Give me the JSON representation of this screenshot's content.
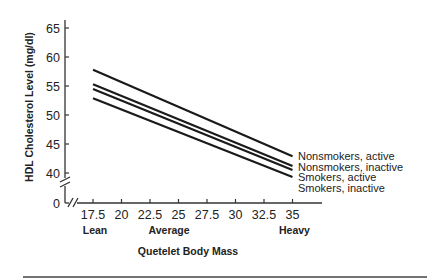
{
  "chart_data": {
    "type": "line",
    "title": "",
    "xlabel": "Quetelet Body Mass",
    "ylabel": "HDL Cholesterol Level (mg/dl)",
    "x_ticks": [
      "17.5",
      "20",
      "22.5",
      "25",
      "27.5",
      "30",
      "32.5",
      "35"
    ],
    "x_tick_values": [
      17.5,
      20,
      22.5,
      25,
      27.5,
      30,
      32.5,
      35
    ],
    "x_categories": [
      {
        "label": "Lean",
        "at": 17.5
      },
      {
        "label": "Average",
        "at": 24
      },
      {
        "label": "Heavy",
        "at": 35
      }
    ],
    "y_ticks": [
      "65",
      "60",
      "55",
      "50",
      "45",
      "40",
      "0"
    ],
    "y_tick_values": [
      65,
      60,
      55,
      50,
      45,
      40,
      0
    ],
    "xlim": [
      17.5,
      35
    ],
    "ylim": [
      40,
      65
    ],
    "axis_breaks": {
      "x": true,
      "y": true
    },
    "grid": false,
    "legend_position": "right, at line ends",
    "x": [
      17.5,
      35
    ],
    "series": [
      {
        "name": "Nonsmokers, active",
        "values": [
          57.8,
          42.9
        ]
      },
      {
        "name": "Nonsmokers, inactive",
        "values": [
          55.3,
          41.2
        ]
      },
      {
        "name": "Smokers, active",
        "values": [
          54.5,
          40.5
        ]
      },
      {
        "name": "Smokers, inactive",
        "values": [
          52.9,
          39.3
        ]
      }
    ]
  },
  "colors": {
    "line": "#1a1a1a",
    "axis": "#333333",
    "background": "#ffffff"
  }
}
